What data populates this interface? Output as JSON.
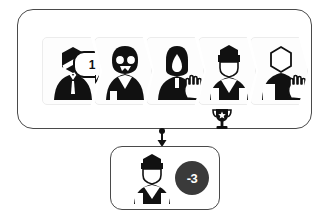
{
  "diagram": {
    "colors": {
      "panel_border": "#4a4a4a",
      "card_fill": "#fdfdfd",
      "card_border": "#ececec",
      "figure_dark": "#111111",
      "figure_light": "#ffffff",
      "badge_fill": "#3a3a3a",
      "badge_text": "#ffffff"
    }
  },
  "top_panel": {
    "name": "candidate-pipeline-panel",
    "steps": [
      {
        "position": 1,
        "avatar": "businessman-suit-tie-avatar",
        "avatar_style": "dark",
        "bubble": {
          "icon": "speech-bubble-icon",
          "value": "1"
        },
        "hand": false,
        "trophy": false
      },
      {
        "position": 2,
        "avatar": "woman-glasses-avatar",
        "avatar_style": "dark",
        "bubble": {
          "icon": "speech-bubble-icon",
          "value": "3"
        },
        "hand": false,
        "trophy": false
      },
      {
        "position": 3,
        "avatar": "hooded-figure-avatar",
        "avatar_style": "dark",
        "bubble": null,
        "hand": true,
        "trophy": false
      },
      {
        "position": 4,
        "avatar": "capped-figure-avatar",
        "avatar_style": "outline",
        "bubble": {
          "icon": "speech-bubble-icon",
          "value": "4"
        },
        "hand": false,
        "trophy": true,
        "trophy_icon": "trophy-star-icon"
      },
      {
        "position": 5,
        "avatar": "blank-figure-avatar",
        "avatar_style": "outline",
        "bubble": null,
        "hand": true,
        "trophy": false
      }
    ]
  },
  "connector": {
    "icon": "down-arrow-icon"
  },
  "bottom_panel": {
    "name": "result-panel",
    "avatar": "capped-figure-avatar",
    "badge": {
      "value": "-3",
      "icon": "score-badge-icon"
    }
  }
}
